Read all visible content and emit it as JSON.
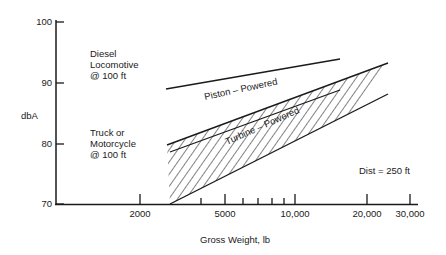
{
  "chart_data": {
    "type": "line",
    "title": "",
    "xlabel": "Gross Weight, lb",
    "ylabel": "dbA",
    "x_scale": "log",
    "ylim": [
      70,
      100
    ],
    "xlim": [
      1400,
      32000
    ],
    "yticks": [
      {
        "value": 100,
        "label": "100",
        "py": 22
      },
      {
        "value": 90,
        "label": "90",
        "py": 83
      },
      {
        "value": 80,
        "label": "80",
        "py": 144
      },
      {
        "value": 70,
        "label": "70",
        "py": 204
      }
    ],
    "xticks": [
      {
        "value": 2000,
        "label": "2000",
        "px": 140,
        "major": true
      },
      {
        "value": 4000,
        "label": "",
        "px": 201,
        "major": false
      },
      {
        "value": 5000,
        "label": "5000",
        "px": 225,
        "major": true
      },
      {
        "value": 6000,
        "label": "",
        "px": 243,
        "major": false
      },
      {
        "value": 7000,
        "label": "",
        "px": 258,
        "major": false
      },
      {
        "value": 8000,
        "label": "",
        "px": 272,
        "major": false
      },
      {
        "value": 9000,
        "label": "",
        "px": 284,
        "major": false
      },
      {
        "value": 10000,
        "label": "10,000",
        "px": 295,
        "major": true
      },
      {
        "value": 20000,
        "label": "20,000",
        "px": 367,
        "major": true
      },
      {
        "value": 30000,
        "label": "30,000",
        "px": 410,
        "major": true
      }
    ],
    "grid": false,
    "series": [
      {
        "name": "Diesel reference line",
        "x": [
          2800,
          15500
        ],
        "y": [
          88.9,
          93.9
        ]
      },
      {
        "name": "Piston-Powered (upper boundary)",
        "x": [
          2800,
          26500
        ],
        "y": [
          79.7,
          93.3
        ]
      },
      {
        "name": "Turbine-Powered (upper boundary)",
        "x": [
          3000,
          15500
        ],
        "y": [
          78.6,
          88.8
        ]
      },
      {
        "name": "Lower boundary",
        "x": [
          3000,
          26500
        ],
        "y": [
          70.0,
          88.1
        ]
      }
    ],
    "shaded_region": {
      "description": "hatched band between upper and lower boundaries",
      "x": [
        3000,
        26500
      ]
    },
    "annotations": [
      {
        "text": "Piston – Powered"
      },
      {
        "text": "Turbine – Powered"
      },
      {
        "text": "Dist = 250 ft"
      },
      {
        "text": "Diesel Locomotive @ 100 ft"
      },
      {
        "text": "Truck or Motorcycle @ 100 ft"
      }
    ]
  },
  "labels": {
    "y_axis": "dbA",
    "x_axis": "Gross Weight, lb",
    "diesel": [
      "Diesel",
      "Locomotive",
      "@ 100 ft"
    ],
    "truck": [
      "Truck or",
      "Motorcycle",
      "@ 100 ft"
    ],
    "piston": "Piston – Powered",
    "turbine": "Turbine – Powered",
    "distance": "Dist = 250 ft"
  },
  "colors": {
    "ink": "#1a1a1a",
    "background": "#ffffff"
  }
}
